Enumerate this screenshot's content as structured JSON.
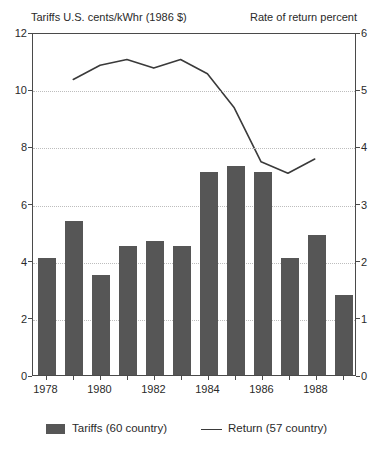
{
  "chart_data": {
    "type": "bar",
    "title_left": "Tariffs U.S. cents/kWhr (1986 $)",
    "title_right": "Rate of return percent",
    "categories": [
      1978,
      1979,
      1980,
      1981,
      1982,
      1983,
      1984,
      1985,
      1986,
      1987,
      1988,
      1989
    ],
    "series": [
      {
        "name": "Tariffs (60 country)",
        "type": "bar",
        "axis": "left",
        "color": "#565656",
        "values": [
          4.1,
          5.4,
          3.5,
          4.5,
          4.7,
          4.5,
          7.1,
          7.3,
          7.1,
          4.1,
          4.9,
          2.8
        ]
      },
      {
        "name": "Return (57 country)",
        "type": "line",
        "axis": "right",
        "color": "#3a3a3a",
        "values": [
          null,
          5.2,
          5.45,
          5.55,
          5.4,
          5.55,
          5.3,
          4.7,
          3.75,
          3.55,
          3.8,
          null
        ]
      }
    ],
    "left_axis": {
      "label": "Tariffs U.S. cents/kWhr (1986 $)",
      "range": [
        0,
        12
      ],
      "ticks": [
        0,
        2,
        4,
        6,
        8,
        10,
        12
      ]
    },
    "right_axis": {
      "label": "Rate of return percent",
      "range": [
        0,
        6
      ],
      "ticks": [
        0,
        1,
        2,
        3,
        4,
        5,
        6
      ]
    },
    "x_tick_labels": [
      "1978",
      "1980",
      "1982",
      "1984",
      "1986",
      "1988"
    ],
    "grid": "dotted horizontal",
    "legend_position": "bottom"
  }
}
